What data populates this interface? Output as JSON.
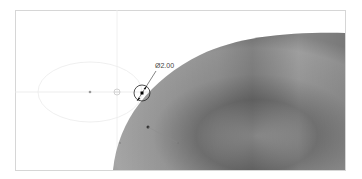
{
  "viewport": {
    "background": "#ffffff",
    "frame_color": "#d6d6d6",
    "construction_line_color": "#e6e6e6"
  },
  "dimension": {
    "label": "Ø2.00",
    "type": "diameter",
    "color": "#222222"
  },
  "model": {
    "shape": "torus-like-surface",
    "shade_light": "#b9b9b9",
    "shade_mid": "#9a9a9a",
    "shade_dark": "#707070"
  }
}
